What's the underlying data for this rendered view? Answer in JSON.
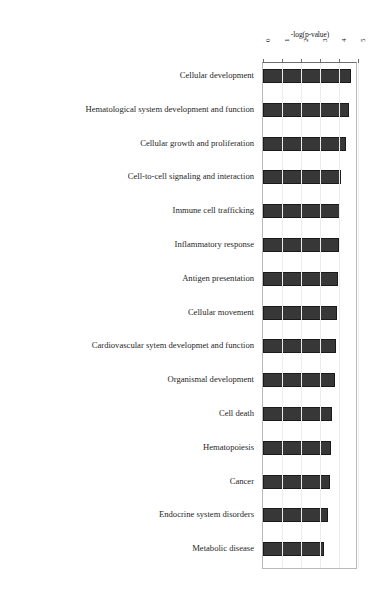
{
  "chart_data": {
    "type": "bar",
    "orientation": "horizontal",
    "title": "",
    "xlabel": "-log(p-value)",
    "ylabel": "",
    "xlim": [
      0,
      5
    ],
    "xticks": [
      "0",
      "1",
      "2",
      "3",
      "4",
      "5"
    ],
    "grid": true,
    "legend": null,
    "bar_color": "#373737",
    "categories": [
      "Cellular development",
      "Hematological system development and function",
      "Cellular growth and proliferation",
      "Cell-to-cell signaling and interaction",
      "Immune cell trafficking",
      "Inflammatory response",
      "Antigen presentation",
      "Cellular movement",
      "Cardiovascular sytem developmet and function",
      "Organismal development",
      "Cell death",
      "Hematopoiesis",
      "Cancer",
      "Endocrine system disorders",
      "Metabolic disease"
    ],
    "values": [
      4.65,
      4.55,
      4.35,
      4.1,
      4.05,
      4.0,
      3.95,
      3.9,
      3.85,
      3.8,
      3.65,
      3.6,
      3.5,
      3.4,
      3.2
    ]
  }
}
